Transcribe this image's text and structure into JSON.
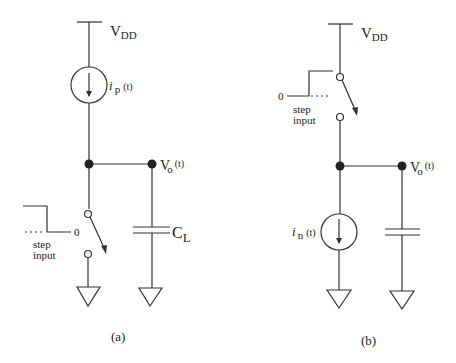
{
  "diagram": {
    "type": "circuit-schematic",
    "panels": [
      {
        "id": "a",
        "caption": "(a)",
        "supply": {
          "label_main": "V",
          "label_sub": "DD"
        },
        "current_source": {
          "label_i": "i",
          "label_sub": "p",
          "label_t": "(t)"
        },
        "output": {
          "label_main": "V",
          "label_sub": "o",
          "label_t": "(t)"
        },
        "switch_input": {
          "level": "0",
          "text_line1": "step",
          "text_line2": "input"
        },
        "capacitor": {
          "label_main": "C",
          "label_sub": "L"
        }
      },
      {
        "id": "b",
        "caption": "(b)",
        "supply": {
          "label_main": "V",
          "label_sub": "DD"
        },
        "current_source": {
          "label_i": "i",
          "label_sub": "n",
          "label_t": "(t)"
        },
        "output": {
          "label_main": "V",
          "label_sub": "o",
          "label_t": "(t)"
        },
        "switch_input": {
          "level": "0",
          "text_line1": "step",
          "text_line2": "input"
        }
      }
    ]
  }
}
